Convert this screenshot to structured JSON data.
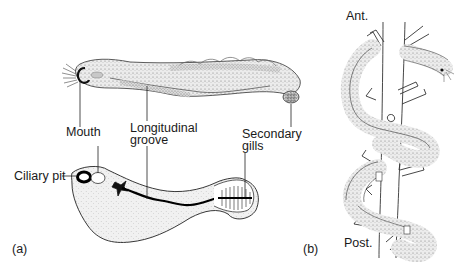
{
  "figure": {
    "panel_a": {
      "tag": "(a)",
      "labels": {
        "mouth": "Mouth",
        "longitudinal_groove_line1": "Longitudinal",
        "longitudinal_groove_line2": "groove",
        "secondary_gills_line1": "Secondary",
        "secondary_gills_line2": "gills",
        "ciliary_pit": "Ciliary pit"
      },
      "views": [
        "lateral view (upper)",
        "ventral view (lower)"
      ]
    },
    "panel_b": {
      "tag": "(b)",
      "labels": {
        "anterior": "Ant.",
        "posterior": "Post."
      }
    },
    "colors": {
      "ink": "#1a1a1a",
      "stipple": "#8c8c8c",
      "body_fill": "#e6e6e6",
      "background": "#ffffff"
    }
  }
}
